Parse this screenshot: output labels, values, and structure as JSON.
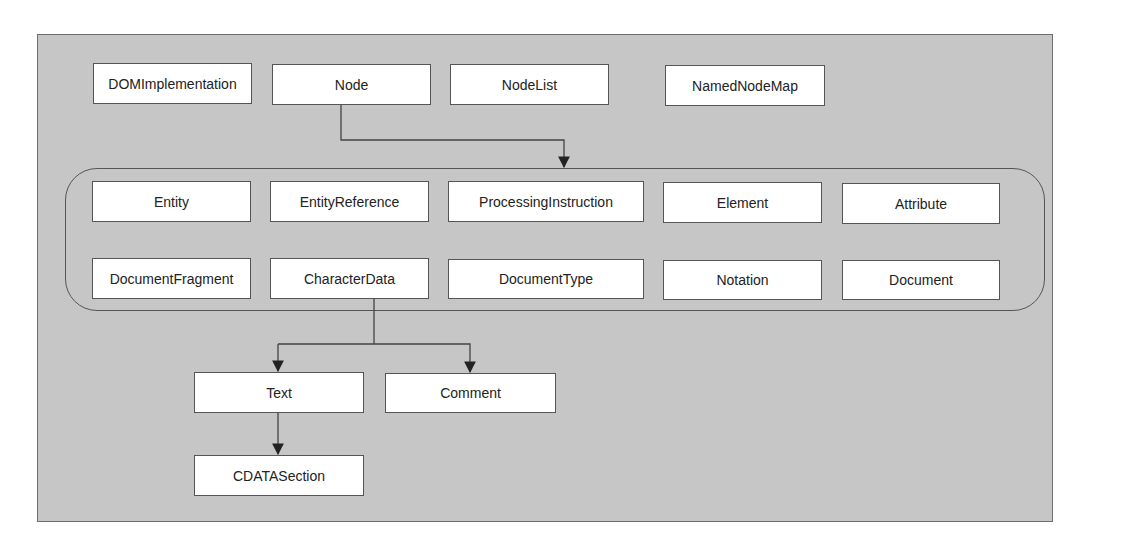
{
  "diagram": {
    "top_row": [
      "DOMImplementation",
      "Node",
      "NodeList",
      "NamedNodeMap"
    ],
    "group_row1": [
      "Entity",
      "EntityReference",
      "ProcessingInstruction",
      "Element",
      "Attribute"
    ],
    "group_row2": [
      "DocumentFragment",
      "CharacterData",
      "DocumentType",
      "Notation",
      "Document"
    ],
    "characterdata_children": [
      "Text",
      "Comment"
    ],
    "text_children": [
      "CDATASection"
    ],
    "edges": [
      {
        "from": "Node",
        "to": "node-types-group"
      },
      {
        "from": "CharacterData",
        "to": "Text"
      },
      {
        "from": "CharacterData",
        "to": "Comment"
      },
      {
        "from": "Text",
        "to": "CDATASection"
      }
    ]
  }
}
